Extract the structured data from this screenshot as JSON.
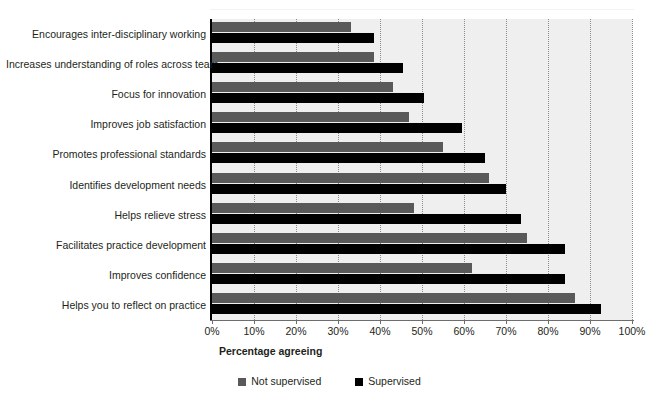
{
  "chart_data": {
    "type": "bar",
    "orientation": "horizontal",
    "title": "",
    "subtitle": "",
    "xlabel": "Percentage agreeing",
    "ylabel": "",
    "xlim": [
      0,
      100
    ],
    "xticks": [
      "0%",
      "10%",
      "20%",
      "30%",
      "40%",
      "50%",
      "60%",
      "70%",
      "80%",
      "90%",
      "100%"
    ],
    "xtick_values": [
      0,
      10,
      20,
      30,
      40,
      50,
      60,
      70,
      80,
      90,
      100
    ],
    "grid": "vertical-dotted",
    "legend_position": "bottom-center",
    "categories": [
      "Encourages inter-disciplinary working",
      "Increases understanding of roles across team",
      "Focus for innovation",
      "Improves job satisfaction",
      "Promotes professional standards",
      "Identifies development needs",
      "Helps relieve stress",
      "Facilitates practice development",
      "Improves confidence",
      "Helps you to reflect on practice"
    ],
    "series": [
      {
        "name": "Not supervised",
        "color": "#595959",
        "values": [
          33,
          38.5,
          43,
          47,
          55,
          66,
          48,
          75,
          62,
          86.5
        ]
      },
      {
        "name": "Supervised",
        "color": "#000000",
        "values": [
          38.5,
          45.5,
          50.5,
          59.5,
          65,
          70,
          73.5,
          84,
          84,
          92.5
        ]
      }
    ]
  },
  "legend": {
    "items": [
      {
        "label": "Not supervised",
        "color": "#595959"
      },
      {
        "label": "Supervised",
        "color": "#000000"
      }
    ]
  },
  "axis": {
    "x_title": "Percentage agreeing"
  }
}
